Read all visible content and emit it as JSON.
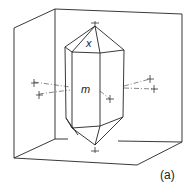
{
  "figure": {
    "panel_label": "(a)",
    "face_labels": {
      "pyramid_face": "x",
      "prism_face": "m"
    },
    "colors": {
      "line": "#222222",
      "axis": "#555555",
      "background": "#ffffff"
    }
  }
}
